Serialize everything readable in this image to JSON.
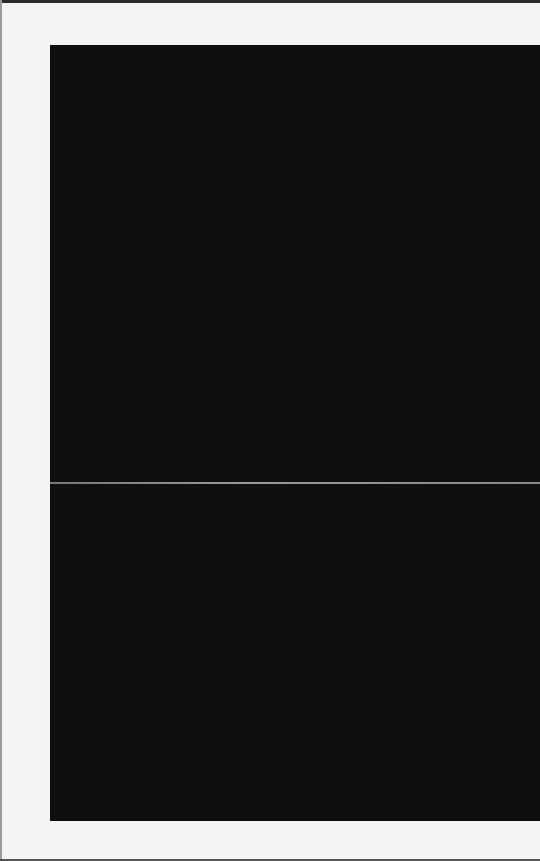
{
  "scene": {
    "description": "Dark near-black panel with a thin light horizontal divider on a white background",
    "colors": {
      "background": "#f4f4f4",
      "panel": "#0d0d0d",
      "divider": "#8a8a8a"
    }
  }
}
